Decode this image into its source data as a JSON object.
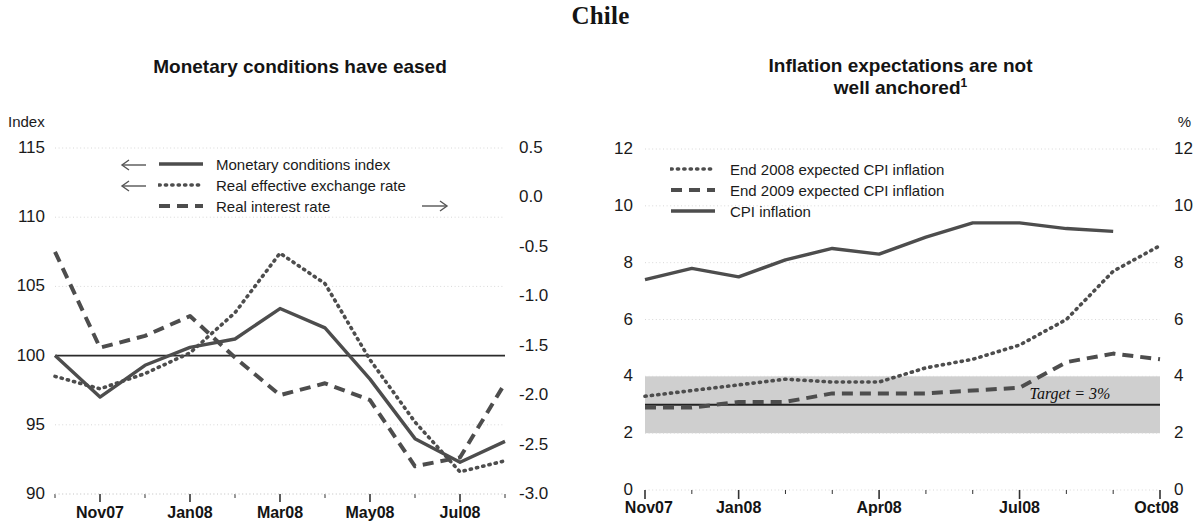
{
  "page": {
    "title": "Chile"
  },
  "left_panel": {
    "title": "Monetary conditions have eased",
    "unit_left": "Index",
    "y_left_ticks": [
      "115",
      "110",
      "105",
      "100",
      "95",
      "90"
    ],
    "y_right_ticks": [
      "0.5",
      "0.0",
      "-0.5",
      "-1.0",
      "-1.5",
      "-2.0",
      "-2.5",
      "-3.0"
    ],
    "x_ticks": [
      "Nov07",
      "Jan08",
      "Mar08",
      "May08",
      "Jul08"
    ],
    "legend": [
      {
        "label": "Monetary conditions index",
        "style": "solid",
        "arrow": "left"
      },
      {
        "label": "Real effective exchange rate",
        "style": "dotted",
        "arrow": "left"
      },
      {
        "label": "Real interest rate",
        "style": "dashed",
        "arrow": "right"
      }
    ]
  },
  "right_panel": {
    "title_line1": "Inflation expectations are not",
    "title_line2": "well anchored",
    "title_footnote": "1",
    "unit_right": "%",
    "y_left_ticks": [
      "12",
      "10",
      "8",
      "6",
      "4",
      "2",
      "0"
    ],
    "y_right_ticks": [
      "12",
      "10",
      "8",
      "6",
      "4",
      "2",
      "0"
    ],
    "x_ticks": [
      "Nov07",
      "Jan08",
      "Apr08",
      "Jul08",
      "Oct08"
    ],
    "legend": [
      {
        "label": "End 2008 expected CPI inflation",
        "style": "dotted"
      },
      {
        "label": "End 2009 expected CPI inflation",
        "style": "dashed"
      },
      {
        "label": "CPI inflation",
        "style": "solid"
      }
    ],
    "target_note": "Target = 3%"
  },
  "colors": {
    "line_dark": "#4d4d4d",
    "line_solid": "#4a4a4a",
    "band_fill": "#cfcfcf",
    "zero_line": "#2b2b2b",
    "grid": "#d8d8d8",
    "text": "#1a1a1a"
  },
  "chart_data": [
    {
      "type": "line",
      "title": "Monetary conditions have eased",
      "xlabel": "",
      "ylabel": "Index",
      "ylabel_right": "",
      "ylim": [
        90,
        115
      ],
      "ylim_right": [
        -3.0,
        0.5
      ],
      "grid": true,
      "legend": "inside-top",
      "x": [
        "Oct07",
        "Nov07",
        "Dec07",
        "Jan08",
        "Feb08",
        "Mar08",
        "Apr08",
        "May08",
        "Jun08",
        "Jul08",
        "Aug08"
      ],
      "xtick_labels": [
        "Nov07",
        "Jan08",
        "Mar08",
        "May08",
        "Jul08"
      ],
      "series": [
        {
          "name": "Monetary conditions index",
          "axis": "left",
          "style": "solid",
          "values": [
            100.0,
            97.0,
            99.3,
            100.6,
            101.2,
            103.4,
            102.0,
            98.3,
            94.0,
            92.3,
            93.8
          ]
        },
        {
          "name": "Real effective exchange rate",
          "axis": "left",
          "style": "dotted",
          "values": [
            98.5,
            97.6,
            98.7,
            100.2,
            103.1,
            107.4,
            105.2,
            99.7,
            95.2,
            91.6,
            92.4
          ]
        },
        {
          "name": "Real interest rate",
          "axis": "right",
          "style": "dashed",
          "values": [
            -0.55,
            -1.52,
            -1.4,
            -1.2,
            -1.62,
            -2.0,
            -1.88,
            -2.05,
            -2.72,
            -2.63,
            -1.88
          ]
        }
      ]
    },
    {
      "type": "line",
      "title": "Inflation expectations are not well anchored",
      "xlabel": "",
      "ylabel": "%",
      "ylim": [
        0,
        12
      ],
      "grid": true,
      "legend": "inside-top",
      "shaded_band": {
        "from": 2,
        "to": 4,
        "label": "Target = 3%",
        "target": 3
      },
      "x": [
        "Nov07",
        "Dec07",
        "Jan08",
        "Feb08",
        "Mar08",
        "Apr08",
        "May08",
        "Jun08",
        "Jul08",
        "Aug08",
        "Sep08",
        "Oct08"
      ],
      "xtick_labels": [
        "Nov07",
        "Jan08",
        "Apr08",
        "Jul08",
        "Oct08"
      ],
      "series": [
        {
          "name": "CPI inflation",
          "style": "solid",
          "values": [
            7.4,
            7.8,
            7.5,
            8.1,
            8.5,
            8.3,
            8.9,
            9.4,
            9.4,
            9.2,
            9.1,
            null
          ]
        },
        {
          "name": "End 2008 expected CPI inflation",
          "style": "dotted",
          "values": [
            3.3,
            3.5,
            3.7,
            3.9,
            3.8,
            3.8,
            4.3,
            4.6,
            5.1,
            6.0,
            7.7,
            8.6
          ]
        },
        {
          "name": "End 2009 expected CPI inflation",
          "style": "dashed",
          "values": [
            2.9,
            2.9,
            3.1,
            3.1,
            3.4,
            3.4,
            3.4,
            3.5,
            3.6,
            4.5,
            4.8,
            4.6
          ]
        }
      ]
    }
  ]
}
